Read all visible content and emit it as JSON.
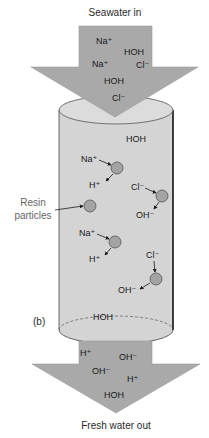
{
  "labels": {
    "inlet": "Seawater in",
    "outlet": "Fresh water out",
    "resin": "Resin particles",
    "resin_line1": "Resin",
    "resin_line2": "particles",
    "panel": "(b)"
  },
  "colors": {
    "arrow_fill": "#a9a9a9",
    "arrow_stroke": "#9a9a9a",
    "cylinder_fill": "#d4d4d4",
    "cylinder_top": "#dcdcdc",
    "cylinder_outline": "#2a2a2a",
    "particle_fill": "#a3a3a3",
    "particle_stroke": "#555555",
    "text": "#1a1a1a"
  },
  "inlet_ions": [
    {
      "text": "Na⁺",
      "x": 96,
      "y": 44
    },
    {
      "text": "HOH",
      "x": 124,
      "y": 55
    },
    {
      "text": "Na⁺",
      "x": 92,
      "y": 67
    },
    {
      "text": "Cl⁻",
      "x": 136,
      "y": 68
    },
    {
      "text": "HOH",
      "x": 104,
      "y": 84
    },
    {
      "text": "Cl⁻",
      "x": 112,
      "y": 101
    }
  ],
  "column_text": [
    {
      "text": "HOH",
      "x": 126,
      "y": 142
    },
    {
      "text": "HOH",
      "x": 93,
      "y": 320
    }
  ],
  "exchange_sites": [
    {
      "type": "cation",
      "in_ion": "Na⁺",
      "out_ion": "H⁺",
      "cx": 117,
      "cy": 168,
      "in_x": 81,
      "in_y": 162,
      "out_x": 89,
      "out_y": 188
    },
    {
      "type": "anion",
      "in_ion": "Cl⁻",
      "out_ion": "OH⁻",
      "cx": 162,
      "cy": 196,
      "in_x": 131,
      "in_y": 190,
      "out_x": 136,
      "out_y": 218
    },
    {
      "type": "cation",
      "in_ion": "Na⁺",
      "out_ion": "H⁺",
      "cx": 115,
      "cy": 242,
      "in_x": 79,
      "in_y": 236,
      "out_x": 89,
      "out_y": 262
    },
    {
      "type": "anion",
      "in_ion": "Cl⁻",
      "out_ion": "OH⁻",
      "cx": 156,
      "cy": 279,
      "in_x": 146,
      "in_y": 258,
      "out_x": 118,
      "out_y": 293
    }
  ],
  "free_resin_particle": {
    "cx": 90,
    "cy": 206
  },
  "outlet_ions": [
    {
      "text": "H⁺",
      "x": 80,
      "y": 356
    },
    {
      "text": "OH⁻",
      "x": 119,
      "y": 360
    },
    {
      "text": "OH⁻",
      "x": 92,
      "y": 374
    },
    {
      "text": "H⁺",
      "x": 127,
      "y": 382
    },
    {
      "text": "HOH",
      "x": 104,
      "y": 398
    }
  ]
}
